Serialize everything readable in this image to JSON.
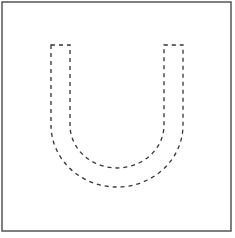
{
  "figure": {
    "frame_color": "#555555",
    "stroke_color": "#333333",
    "background": "#ffffff",
    "shape": {
      "name": "U-shape",
      "outer_left_x": 51,
      "outer_right_x": 183,
      "inner_left_x": 70,
      "inner_right_x": 164,
      "top_y": 45,
      "outer_bottom_y": 187,
      "inner_bottom_y": 168
    }
  }
}
